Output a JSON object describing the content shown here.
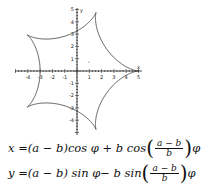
{
  "chart_data": {
    "type": "line",
    "title": "",
    "xlabel": "x",
    "ylabel": "y",
    "xlim": [
      -5,
      5
    ],
    "ylim": [
      -5,
      5
    ],
    "x_ticks": [
      -4,
      -3,
      -2,
      -1,
      1,
      2,
      3,
      4,
      5
    ],
    "y_ticks": [
      -4,
      -3,
      -2,
      -1,
      1,
      2,
      3,
      4,
      5
    ],
    "parameters": {
      "a": 5,
      "b": 1
    },
    "cusps": [
      [
        5,
        0
      ],
      [
        1.55,
        4.76
      ],
      [
        -4.05,
        2.94
      ],
      [
        -4.05,
        -2.94
      ],
      [
        1.55,
        -4.76
      ]
    ],
    "grid": false,
    "legend": null
  },
  "axis": {
    "x_label": "x",
    "y_label": "y",
    "x_tick_labels": [
      "-4",
      "-3",
      "-2",
      "-1",
      "1",
      "2",
      "3",
      "4",
      "5"
    ],
    "y_tick_labels": [
      "5",
      "4",
      "3",
      "2",
      "1",
      "-1",
      "-2",
      "-3",
      "-4"
    ]
  },
  "equations": {
    "x": {
      "lhs": "x = ",
      "part1": "(a − b)",
      "part2": "cos φ + b cos",
      "num": "a − b",
      "den": "b",
      "tail": "φ"
    },
    "y": {
      "lhs": "y = ",
      "part1": "(a − b) sin φ",
      "part2": " − b sin",
      "num": "a − b",
      "den": "b",
      "tail": "φ"
    }
  }
}
